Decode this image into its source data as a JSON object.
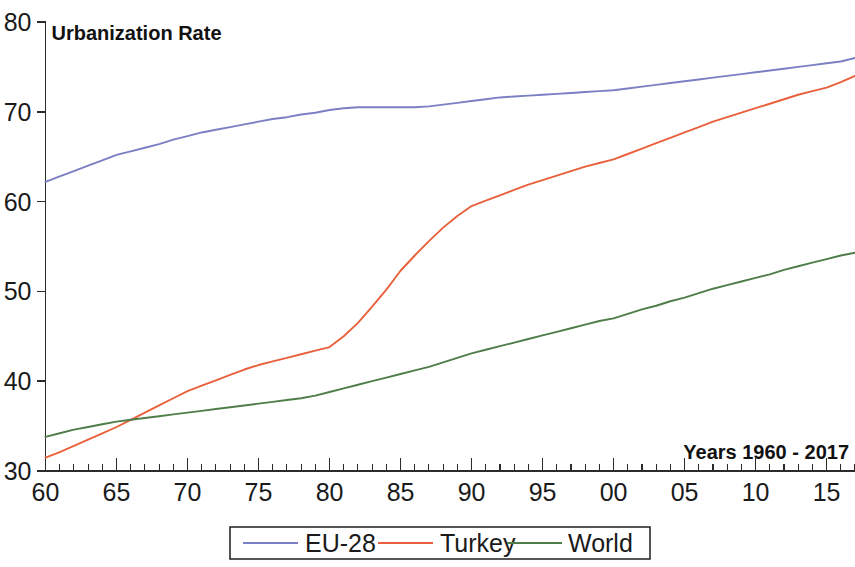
{
  "chart_data": {
    "type": "line",
    "title": "Urbanization Rate",
    "annotation": "Years 1960 - 2017",
    "xlabel": "",
    "ylabel": "",
    "xlim": [
      1960,
      2017
    ],
    "ylim": [
      30,
      80
    ],
    "grid": false,
    "legend_position": "bottom",
    "y_ticks": [
      30,
      40,
      50,
      60,
      70,
      80
    ],
    "y_tick_labels": [
      "30",
      "40",
      "50",
      "60",
      "70",
      "80"
    ],
    "x_ticks": [
      1960,
      1965,
      1970,
      1975,
      1980,
      1985,
      1990,
      1995,
      2000,
      2005,
      2010,
      2015
    ],
    "x_tick_labels": [
      "60",
      "65",
      "70",
      "75",
      "80",
      "85",
      "90",
      "95",
      "00",
      "05",
      "10",
      "15"
    ],
    "x_minor_tick_step": 1,
    "x": [
      1960,
      1961,
      1962,
      1963,
      1964,
      1965,
      1966,
      1967,
      1968,
      1969,
      1970,
      1971,
      1972,
      1973,
      1974,
      1975,
      1976,
      1977,
      1978,
      1979,
      1980,
      1981,
      1982,
      1983,
      1984,
      1985,
      1986,
      1987,
      1988,
      1989,
      1990,
      1991,
      1992,
      1993,
      1994,
      1995,
      1996,
      1997,
      1998,
      1999,
      2000,
      2001,
      2002,
      2003,
      2004,
      2005,
      2006,
      2007,
      2008,
      2009,
      2010,
      2011,
      2012,
      2013,
      2014,
      2015,
      2016,
      2017
    ],
    "series": [
      {
        "name": "EU-28",
        "color": "#7b7fc4",
        "values": [
          62.2,
          62.8,
          63.4,
          64.0,
          64.6,
          65.2,
          65.6,
          66.0,
          66.4,
          66.9,
          67.3,
          67.7,
          68.0,
          68.3,
          68.6,
          68.9,
          69.2,
          69.4,
          69.7,
          69.9,
          70.2,
          70.4,
          70.5,
          70.5,
          70.5,
          70.5,
          70.5,
          70.6,
          70.8,
          71.0,
          71.2,
          71.4,
          71.6,
          71.7,
          71.8,
          71.9,
          72.0,
          72.1,
          72.2,
          72.3,
          72.4,
          72.6,
          72.8,
          73.0,
          73.2,
          73.4,
          73.6,
          73.8,
          74.0,
          74.2,
          74.4,
          74.6,
          74.8,
          75.0,
          75.2,
          75.4,
          75.6,
          76.0
        ]
      },
      {
        "name": "Turkey",
        "color": "#e8613c",
        "values": [
          31.5,
          32.1,
          32.8,
          33.5,
          34.2,
          34.9,
          35.7,
          36.5,
          37.3,
          38.1,
          38.9,
          39.5,
          40.1,
          40.7,
          41.3,
          41.8,
          42.2,
          42.6,
          43.0,
          43.4,
          43.8,
          45.0,
          46.5,
          48.3,
          50.2,
          52.3,
          54.0,
          55.6,
          57.1,
          58.4,
          59.5,
          60.1,
          60.7,
          61.3,
          61.9,
          62.4,
          62.9,
          63.4,
          63.9,
          64.3,
          64.7,
          65.3,
          65.9,
          66.5,
          67.1,
          67.7,
          68.3,
          68.9,
          69.4,
          69.9,
          70.4,
          70.9,
          71.4,
          71.9,
          72.3,
          72.7,
          73.3,
          74.0
        ]
      },
      {
        "name": "World",
        "color": "#4f7d4a",
        "values": [
          33.8,
          34.2,
          34.6,
          34.9,
          35.2,
          35.5,
          35.7,
          35.9,
          36.1,
          36.3,
          36.5,
          36.7,
          36.9,
          37.1,
          37.3,
          37.5,
          37.7,
          37.9,
          38.1,
          38.4,
          38.8,
          39.2,
          39.6,
          40.0,
          40.4,
          40.8,
          41.2,
          41.6,
          42.1,
          42.6,
          43.1,
          43.5,
          43.9,
          44.3,
          44.7,
          45.1,
          45.5,
          45.9,
          46.3,
          46.7,
          47.0,
          47.5,
          48.0,
          48.4,
          48.9,
          49.3,
          49.8,
          50.3,
          50.7,
          51.1,
          51.5,
          51.9,
          52.4,
          52.8,
          53.2,
          53.6,
          54.0,
          54.3
        ]
      }
    ]
  },
  "legend": {
    "items": [
      {
        "label": "EU-28",
        "color": "#7b7fc4"
      },
      {
        "label": "Turkey",
        "color": "#e8613c"
      },
      {
        "label": "World",
        "color": "#4f7d4a"
      }
    ]
  }
}
